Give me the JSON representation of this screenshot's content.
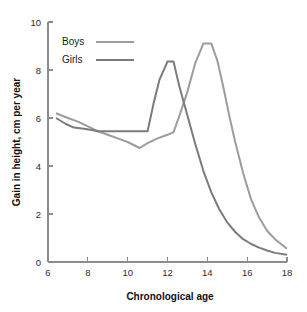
{
  "chart_data": {
    "type": "line",
    "title": "",
    "xlabel": "Chronological age",
    "ylabel": "Gain in height, cm per year",
    "xlim": [
      6,
      18
    ],
    "ylim": [
      0,
      10
    ],
    "xticks": [
      6,
      8,
      10,
      12,
      14,
      16,
      18
    ],
    "yticks": [
      0,
      2,
      4,
      6,
      8,
      10
    ],
    "grid": false,
    "legend_position": "top-left inside plot",
    "series": [
      {
        "name": "Boys",
        "color": "#9c9c9c",
        "x": [
          6.4,
          7.0,
          7.5,
          8.0,
          8.5,
          9.0,
          9.5,
          10.0,
          10.6,
          11.0,
          11.5,
          12.0,
          12.3,
          12.6,
          13.0,
          13.4,
          13.8,
          14.2,
          14.5,
          14.8,
          15.1,
          15.4,
          15.8,
          16.2,
          16.6,
          17.0,
          17.4,
          18.0
        ],
        "y": [
          6.2,
          6.0,
          5.85,
          5.65,
          5.45,
          5.3,
          5.15,
          5.0,
          4.75,
          4.95,
          5.15,
          5.3,
          5.4,
          6.1,
          7.1,
          8.3,
          9.1,
          9.1,
          8.4,
          7.3,
          6.1,
          5.0,
          3.7,
          2.6,
          1.85,
          1.3,
          0.95,
          0.55
        ]
      },
      {
        "name": "Girls",
        "color": "#7b7b7b",
        "x": [
          6.4,
          6.9,
          7.3,
          7.8,
          8.2,
          8.5,
          9.2,
          10.0,
          11.0,
          11.3,
          11.6,
          12.0,
          12.3,
          12.6,
          13.0,
          13.4,
          13.8,
          14.2,
          14.6,
          15.0,
          15.4,
          15.8,
          16.2,
          16.6,
          17.0,
          17.4,
          18.0
        ],
        "y": [
          6.0,
          5.75,
          5.6,
          5.55,
          5.5,
          5.45,
          5.45,
          5.45,
          5.45,
          6.6,
          7.6,
          8.35,
          8.35,
          7.3,
          6.1,
          4.9,
          3.8,
          2.9,
          2.2,
          1.65,
          1.25,
          0.95,
          0.75,
          0.6,
          0.48,
          0.38,
          0.3
        ]
      }
    ],
    "legend": [
      {
        "label": "Boys"
      },
      {
        "label": "Girls"
      }
    ]
  },
  "axes": {
    "y_tick_labels": [
      "0",
      "2",
      "4",
      "6",
      "8",
      "10"
    ],
    "x_tick_labels": [
      "6",
      "8",
      "10",
      "12",
      "14",
      "16",
      "18"
    ],
    "y_title": "Gain in height, cm per year",
    "x_title": "Chronological age"
  },
  "legend": {
    "items": [
      {
        "label": "Boys"
      },
      {
        "label": "Girls"
      }
    ]
  }
}
